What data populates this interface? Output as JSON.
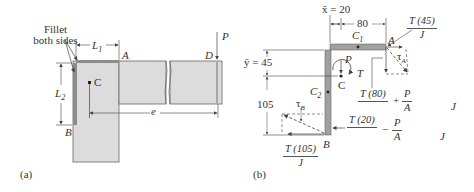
{
  "diagram_a": {
    "panel_label": "(a)",
    "fillet_note_line1": "Fillet",
    "fillet_note_line2": "both sides",
    "labels": {
      "L1": "L",
      "L1_sub": "1",
      "L2": "L",
      "L2_sub": "2",
      "A": "A",
      "B": "B",
      "C": "C",
      "D": "D",
      "P": "P",
      "e": "e"
    }
  },
  "diagram_b": {
    "panel_label": "(b)",
    "x_bar": "x̄ = 20",
    "dim_80": "80",
    "y_bar": "ȳ = 45",
    "dim_105": "105",
    "labels": {
      "C1": "C",
      "C1_sub": "1",
      "C2": "C",
      "C2_sub": "2",
      "A": "A",
      "B": "B",
      "C": "C",
      "P": "P",
      "T": "T",
      "tauA": "τ",
      "tauA_sub": "A",
      "tauB": "τ",
      "tauB_sub": "B"
    },
    "expr_TA": {
      "num": "T (45)",
      "den": "J"
    },
    "expr_vertA": {
      "num": "T (80)",
      "op": "+",
      "frac2_num": "P",
      "frac2_den": "A",
      "trail": "J"
    },
    "expr_horizB": {
      "num": "T (20)",
      "op": "−",
      "frac2_num": "P",
      "frac2_den": "A",
      "trail": "J"
    },
    "expr_TB": {
      "num": "T (105)",
      "den": "J"
    }
  },
  "colors": {
    "plate": "#d9d9d9",
    "weld": "#8c8c8c",
    "line": "#444444"
  }
}
